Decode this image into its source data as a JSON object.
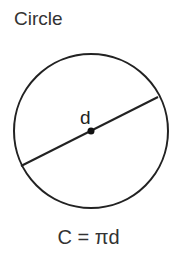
{
  "title": "Circle",
  "diagram": {
    "shape": "circle",
    "diameter_label": "d",
    "center": [
      91,
      131
    ],
    "radius": 77,
    "diameter_endpoints": [
      [
        21,
        166
      ],
      [
        158,
        97
      ]
    ]
  },
  "formula": "C = πd"
}
